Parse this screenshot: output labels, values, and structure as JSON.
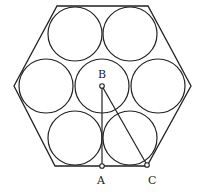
{
  "diagram": {
    "hexagon": {
      "points": [
        [
          57,
          6
        ],
        [
          148,
          6
        ],
        [
          191,
          86
        ],
        [
          147,
          166
        ],
        [
          55,
          166
        ],
        [
          14,
          86
        ]
      ]
    },
    "circles": [
      {
        "cx": 75,
        "cy": 34,
        "r": 27
      },
      {
        "cx": 130,
        "cy": 34,
        "r": 27
      },
      {
        "cx": 46,
        "cy": 86,
        "r": 27
      },
      {
        "cx": 102,
        "cy": 86,
        "r": 27
      },
      {
        "cx": 158,
        "cy": 86,
        "r": 27
      },
      {
        "cx": 75,
        "cy": 138,
        "r": 27
      },
      {
        "cx": 130,
        "cy": 138,
        "r": 27
      }
    ],
    "points": [
      {
        "label": "B",
        "x": 102,
        "y": 86,
        "lx": 98,
        "ly": 78
      },
      {
        "label": "A",
        "x": 102,
        "y": 166,
        "lx": 98,
        "ly": 184
      },
      {
        "label": "C",
        "x": 147,
        "y": 165,
        "lx": 149,
        "ly": 184
      }
    ],
    "segments": [
      [
        "B",
        "A"
      ],
      [
        "B",
        "C"
      ]
    ]
  }
}
